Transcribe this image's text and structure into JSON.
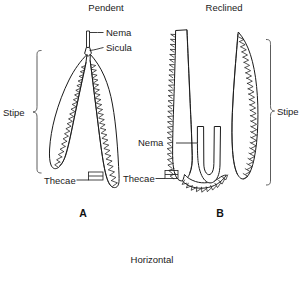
{
  "figure": {
    "caption_bottom": "Horizontal",
    "panels": [
      {
        "id": "A",
        "heading": "Pendent",
        "panel_letter": "A",
        "labels": {
          "nema": "Nema",
          "sicula": "Sicula",
          "thecae": "Thecae",
          "stipe": "Stipe"
        }
      },
      {
        "id": "B",
        "heading": "Reclined",
        "panel_letter": "B",
        "labels": {
          "nema": "Nema",
          "thecae": "Thecae",
          "stipe": "Stipe"
        }
      }
    ]
  },
  "colors": {
    "background": "#ffffff",
    "ink": "#1b1b1b",
    "text": "#1a1a1a",
    "bracket": "#4a4a4a"
  }
}
